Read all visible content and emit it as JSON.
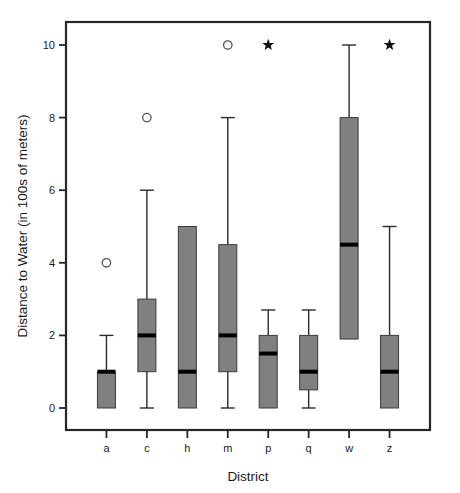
{
  "chart_data": {
    "type": "box",
    "title": "",
    "xlabel": "District",
    "ylabel": "Distance to Water (in 100s of meters)",
    "categories": [
      "a",
      "c",
      "h",
      "m",
      "p",
      "q",
      "w",
      "z"
    ],
    "ytick_labels": [
      "0",
      "2",
      "4",
      "6",
      "8",
      "10"
    ],
    "yticks": [
      0,
      2,
      4,
      6,
      8,
      10
    ],
    "ylim": [
      -0.55,
      10.7
    ],
    "grid": false,
    "legend": null,
    "box_color": "#808080",
    "median_color": "#000000",
    "outlier_marker": "open-circle",
    "flag_marker": "filled-star",
    "boxes": [
      {
        "category": "a",
        "q1": 0.0,
        "median": 1.0,
        "q3": 1.0,
        "whisker_low": 0.0,
        "whisker_high": 2.0,
        "outliers": [
          4.0
        ],
        "stars": []
      },
      {
        "category": "c",
        "q1": 1.0,
        "median": 2.0,
        "q3": 3.0,
        "whisker_low": 0.0,
        "whisker_high": 6.0,
        "outliers": [
          8.0
        ],
        "stars": []
      },
      {
        "category": "h",
        "q1": 0.0,
        "median": 1.0,
        "q3": 5.0,
        "whisker_low": 0.0,
        "whisker_high": 5.0,
        "outliers": [],
        "stars": []
      },
      {
        "category": "m",
        "q1": 1.0,
        "median": 2.0,
        "q3": 4.5,
        "whisker_low": 0.0,
        "whisker_high": 8.0,
        "outliers": [
          10.0
        ],
        "stars": []
      },
      {
        "category": "p",
        "q1": 0.0,
        "median": 1.5,
        "q3": 2.0,
        "whisker_low": 0.0,
        "whisker_high": 2.7,
        "outliers": [],
        "stars": [
          10.0
        ]
      },
      {
        "category": "q",
        "q1": 0.5,
        "median": 1.0,
        "q3": 2.0,
        "whisker_low": 0.0,
        "whisker_high": 2.7,
        "outliers": [],
        "stars": []
      },
      {
        "category": "w",
        "q1": 1.9,
        "median": 4.5,
        "q3": 8.0,
        "whisker_low": 1.9,
        "whisker_high": 10.0,
        "outliers": [],
        "stars": []
      },
      {
        "category": "z",
        "q1": 0.0,
        "median": 1.0,
        "q3": 2.0,
        "whisker_low": 0.0,
        "whisker_high": 5.0,
        "outliers": [],
        "stars": [
          10.0
        ]
      }
    ]
  }
}
